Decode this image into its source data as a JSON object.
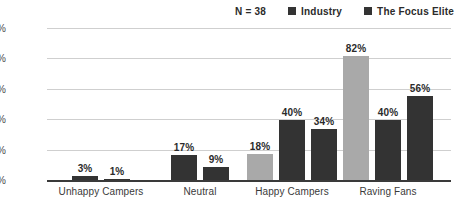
{
  "legend": {
    "sample_size": "N = 38",
    "entries": [
      {
        "label": "Industry",
        "color": "#333333",
        "swatch_name": "legend-swatch-industry"
      },
      {
        "label": "The Focus Elite",
        "color": "#333333",
        "swatch_name": "legend-swatch-focus-elite"
      }
    ]
  },
  "axis": {
    "y_ticks": [
      "0%",
      "20%",
      "40%",
      "60%",
      "80%",
      "100%"
    ],
    "y_tick_values": [
      0,
      20,
      40,
      60,
      80,
      100
    ]
  },
  "categories": [
    "Unhappy Campers",
    "Neutral",
    "Happy Campers",
    "Raving Fans"
  ],
  "bars": [
    {
      "category": "Unhappy Campers",
      "label": "3%",
      "value": 3,
      "color": "#333333",
      "tone": "dark"
    },
    {
      "category": "Unhappy Campers",
      "label": "1%",
      "value": 1,
      "color": "#333333",
      "tone": "dark"
    },
    {
      "category": "Neutral",
      "label": "17%",
      "value": 17,
      "color": "#333333",
      "tone": "dark"
    },
    {
      "category": "Neutral",
      "label": "9%",
      "value": 9,
      "color": "#333333",
      "tone": "dark"
    },
    {
      "category": "Happy Campers",
      "label": "18%",
      "value": 18,
      "color": "#a9a9a9",
      "tone": "light"
    },
    {
      "category": "Happy Campers",
      "label": "40%",
      "value": 40,
      "color": "#333333",
      "tone": "dark"
    },
    {
      "category": "Happy Campers",
      "label": "34%",
      "value": 34,
      "color": "#333333",
      "tone": "dark"
    },
    {
      "category": "Raving Fans",
      "label": "82%",
      "value": 82,
      "color": "#a9a9a9",
      "tone": "light"
    },
    {
      "category": "Raving Fans",
      "label": "40%",
      "value": 40,
      "color": "#333333",
      "tone": "dark"
    },
    {
      "category": "Raving Fans",
      "label": "56%",
      "value": 56,
      "color": "#333333",
      "tone": "dark"
    }
  ],
  "chart_data": {
    "type": "bar",
    "title": "",
    "subtitle": "",
    "xlabel": "",
    "ylabel": "",
    "ylim": [
      0,
      100
    ],
    "y_ticks": [
      0,
      20,
      40,
      60,
      80,
      100
    ],
    "y_tick_labels": [
      "0%",
      "20%",
      "40%",
      "60%",
      "80%",
      "100%"
    ],
    "grid": true,
    "legend_position": "top-right",
    "annotations": [
      "N = 38"
    ],
    "categories": [
      "Unhappy Campers",
      "Neutral",
      "Happy Campers",
      "Raving Fans"
    ],
    "series": [
      {
        "name": "Unlabeled (light gray)",
        "color": "#a9a9a9",
        "values": [
          null,
          null,
          18,
          82
        ]
      },
      {
        "name": "Industry",
        "color": "#333333",
        "values": [
          3,
          17,
          40,
          40
        ]
      },
      {
        "name": "The Focus Elite",
        "color": "#333333",
        "values": [
          1,
          9,
          34,
          56
        ]
      }
    ],
    "data_labels": [
      {
        "category": "Unhappy Campers",
        "values": [
          "3%",
          "1%"
        ]
      },
      {
        "category": "Neutral",
        "values": [
          "17%",
          "9%"
        ]
      },
      {
        "category": "Happy Campers",
        "values": [
          "18%",
          "40%",
          "34%"
        ]
      },
      {
        "category": "Raving Fans",
        "values": [
          "82%",
          "40%",
          "56%"
        ]
      }
    ]
  },
  "layout": {
    "plot_left": 47,
    "plot_top": 29,
    "plot_width": 404,
    "plot_height": 152,
    "bar_width": 26,
    "bar_gap": 6,
    "group_centers": [
      101,
      200,
      292,
      388
    ]
  },
  "colors": {
    "light_gray": "#a9a9a9",
    "dark_gray": "#333333",
    "gridline": "#cfcfcf",
    "axis": "#3a3a3a",
    "text": "#333333",
    "background": "#ffffff"
  }
}
